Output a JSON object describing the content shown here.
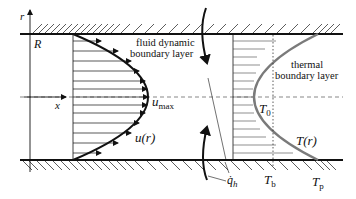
{
  "diagram": {
    "axes": {
      "r_label": "r",
      "x_label": "x",
      "R_label": "R"
    },
    "velocity": {
      "region_label_line1": "fluid dynamic",
      "region_label_line2": "boundary layer",
      "umax_main": "u",
      "umax_sub": "max",
      "profile_label": "u(r)"
    },
    "thermal": {
      "region_label_line1": "thermal",
      "region_label_line2": "boundary layer",
      "T0_main": "T",
      "T0_sub": "0",
      "profile_label": "T(r)",
      "Tb_main": "T",
      "Tb_sub": "b",
      "Tp_main": "T",
      "Tp_sub": "p"
    },
    "heat_flux": {
      "main": "q̇",
      "sub": "h"
    },
    "colors": {
      "line": "#111111",
      "thermal_curve": "#7a7a7a",
      "hatch": "#333333",
      "dashed": "#555555"
    }
  }
}
